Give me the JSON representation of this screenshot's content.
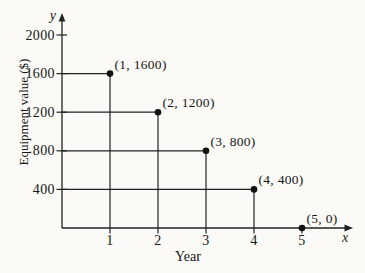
{
  "figure": {
    "xlabel": "Year",
    "ylabel": "Equipment value ($)",
    "x_axis_letter": "x",
    "y_axis_letter": "y"
  },
  "chart_data": {
    "type": "scatter",
    "title": "",
    "xlabel": "Year",
    "ylabel": "Equipment value ($)",
    "x_axis_letter": "x",
    "y_axis_letter": "y",
    "points": [
      {
        "x": 1,
        "y": 1600,
        "label": "(1, 1600)"
      },
      {
        "x": 2,
        "y": 1200,
        "label": "(2, 1200)"
      },
      {
        "x": 3,
        "y": 800,
        "label": "(3, 800)"
      },
      {
        "x": 4,
        "y": 400,
        "label": "(4, 400)"
      },
      {
        "x": 5,
        "y": 0,
        "label": "(5, 0)"
      }
    ],
    "x_ticks": [
      1,
      2,
      3,
      4,
      5
    ],
    "y_ticks": [
      400,
      800,
      1200,
      1600,
      2000
    ],
    "xlim": [
      0,
      5.9
    ],
    "ylim": [
      0,
      2240
    ],
    "grid": false,
    "drop_lines": true,
    "legend": "none",
    "colors": {
      "ink": "#222222",
      "text": "#161616",
      "point": "#111111",
      "paper": "#fbfaf7"
    }
  }
}
